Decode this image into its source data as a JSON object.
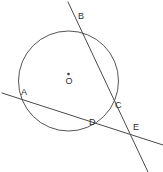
{
  "figure": {
    "width": 163,
    "height": 172,
    "background_color": "#ffffff",
    "stroke_color": "#4a4a4a",
    "circle_stroke_color": "#555555",
    "label_color": "#2e2e2e"
  },
  "circle": {
    "center_label": "O",
    "center_x": 68.5,
    "center_y": 81,
    "radius": 50
  },
  "points": [
    {
      "label": "A",
      "x": 22,
      "y": 101,
      "label_x": 21,
      "label_y": 88,
      "on_circle": true
    },
    {
      "label": "B",
      "x": 76,
      "y": 23,
      "label_x": 78,
      "label_y": 12,
      "on_circle": true
    },
    {
      "label": "C",
      "x": 113,
      "y": 108,
      "label_x": 115,
      "label_y": 101,
      "on_circle": true
    },
    {
      "label": "D",
      "x": 95,
      "y": 128,
      "label_x": 89,
      "label_y": 118,
      "on_circle": true
    },
    {
      "label": "E",
      "x": 131,
      "y": 134,
      "label_x": 133,
      "label_y": 123,
      "on_circle": false
    }
  ],
  "lines": [
    {
      "name": "secant-bce",
      "x1": 68,
      "y1": 2,
      "x2": 148,
      "y2": 172
    },
    {
      "name": "secant-ade",
      "x1": 2,
      "y1": 93,
      "x2": 163,
      "y2": 145
    }
  ]
}
